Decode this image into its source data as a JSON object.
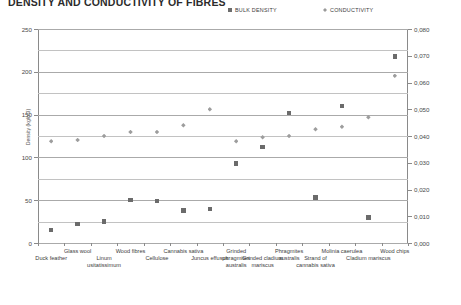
{
  "title": "DENSITY AND CONDUCTIVITY OF FIBRES",
  "legend": [
    {
      "label": "BULK DENSITY",
      "marker": "square-marker-icon",
      "color": "#6d6d6d"
    },
    {
      "label": "CONDUCTIVITY",
      "marker": "diamond-marker-icon",
      "color": "#9a9a9a"
    }
  ],
  "axes": {
    "left_label": "Density (kg/m3)",
    "right_label": "Conductivity (W/mK)",
    "left_ticks": [
      "0",
      "50",
      "100",
      "150",
      "200",
      "250"
    ],
    "right_ticks": [
      "0,000",
      "0,010",
      "0,020",
      "0,030",
      "0,040",
      "0,050",
      "0,060",
      "0,070",
      "0,080"
    ]
  },
  "chart_data": {
    "type": "scatter",
    "title": "DENSITY AND CONDUCTIVITY OF FIBRES",
    "xlabel": "",
    "ylabel": "Density (kg/m3)",
    "y2label": "Conductivity (W/mK)",
    "ylim": [
      0,
      250
    ],
    "y2lim": [
      0.0,
      0.08
    ],
    "grid": true,
    "legend_position": "top-right",
    "categories": [
      "Duck feather",
      "Glass wool",
      "Linum usitatissimum",
      "Wood fibres",
      "Cellulose",
      "Cannabis sativa",
      "Juncus effusus",
      "Grinded phragmites australis",
      "Grinded cladium mariscus",
      "Phragmites australis",
      "Strand of cannabis sativa",
      "Molinia caerulea",
      "Cladium mariscus",
      "Wood chips"
    ],
    "series": [
      {
        "name": "BULK DENSITY",
        "axis": "left",
        "unit": "kg/m3",
        "marker": "square",
        "color": "#6b6b6b",
        "values": [
          15,
          22,
          25,
          50,
          49,
          38,
          40,
          93,
          112,
          152,
          53,
          160,
          30,
          218
        ]
      },
      {
        "name": "CONDUCTIVITY",
        "axis": "right",
        "unit": "W/mK",
        "marker": "diamond",
        "color": "#9d9d9d",
        "values": [
          0.038,
          0.0385,
          0.04,
          0.0415,
          0.0415,
          0.044,
          0.05,
          0.038,
          0.0395,
          0.04,
          0.0425,
          0.0435,
          0.047,
          0.0625
        ]
      }
    ]
  }
}
